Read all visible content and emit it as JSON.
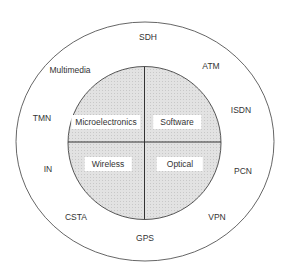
{
  "diagram": {
    "outer_ring_labels": [
      {
        "text": "SDH",
        "x": 148,
        "y": 37
      },
      {
        "text": "Multimedia",
        "x": 70,
        "y": 70
      },
      {
        "text": "ATM",
        "x": 211,
        "y": 66
      },
      {
        "text": "TMN",
        "x": 42,
        "y": 118
      },
      {
        "text": "ISDN",
        "x": 241,
        "y": 110
      },
      {
        "text": "IN",
        "x": 48,
        "y": 169
      },
      {
        "text": "PCN",
        "x": 243,
        "y": 171
      },
      {
        "text": "CSTA",
        "x": 76,
        "y": 217
      },
      {
        "text": "VPN",
        "x": 217,
        "y": 217
      },
      {
        "text": "GPS",
        "x": 145,
        "y": 238
      }
    ],
    "quadrants": [
      {
        "text": "Microelectronics",
        "x": 106,
        "y": 122
      },
      {
        "text": "Software",
        "x": 177,
        "y": 122
      },
      {
        "text": "Wireless",
        "x": 108,
        "y": 164
      },
      {
        "text": "Optical",
        "x": 180,
        "y": 164
      }
    ],
    "colors": {
      "stroke": "#333333",
      "inner_fill": "#dcdcdc",
      "background": "#ffffff"
    }
  }
}
